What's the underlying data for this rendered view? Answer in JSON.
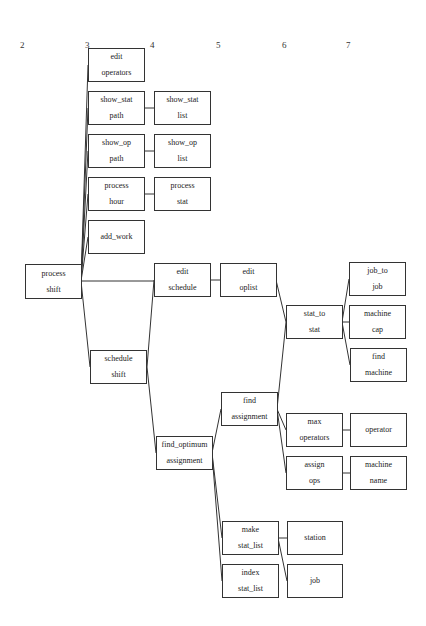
{
  "columns": [
    {
      "label": "2",
      "x": 20,
      "y": 40
    },
    {
      "label": "3",
      "x": 85,
      "y": 40
    },
    {
      "label": "4",
      "x": 150,
      "y": 40
    },
    {
      "label": "5",
      "x": 216,
      "y": 40
    },
    {
      "label": "6",
      "x": 282,
      "y": 40
    },
    {
      "label": "7",
      "x": 346,
      "y": 40
    }
  ],
  "nodes": {
    "process_shift": {
      "line1": "process",
      "line2": "shift"
    },
    "edit_operators": {
      "line1": "edit",
      "line2": "operators"
    },
    "show_stat_path": {
      "line1": "show_stat",
      "line2": "path"
    },
    "show_stat_list": {
      "line1": "show_stat",
      "line2": "list"
    },
    "show_op_path": {
      "line1": "show_op",
      "line2": "path"
    },
    "show_op_list": {
      "line1": "show_op",
      "line2": "list"
    },
    "process_hour": {
      "line1": "process",
      "line2": "hour"
    },
    "process_stat": {
      "line1": "process",
      "line2": "stat"
    },
    "add_work": {
      "line1": "add_work",
      "line2": ""
    },
    "edit_schedule": {
      "line1": "edit",
      "line2": "schedule"
    },
    "edit_oplist": {
      "line1": "edit",
      "line2": "oplist"
    },
    "schedule_shift": {
      "line1": "schedule",
      "line2": "shift"
    },
    "stat_to_stat": {
      "line1": "stat_to",
      "line2": "stat"
    },
    "job_to_job": {
      "line1": "job_to",
      "line2": "job"
    },
    "machine_cap": {
      "line1": "machine",
      "line2": "cap"
    },
    "find_machine": {
      "line1": "find",
      "line2": "machine"
    },
    "find_assignment": {
      "line1": "find",
      "line2": "assignment"
    },
    "find_optimum_assignment": {
      "line1": "find_optimum",
      "line2": "assignment"
    },
    "max_operators": {
      "line1": "max",
      "line2": "operators"
    },
    "operator": {
      "line1": "operator",
      "line2": ""
    },
    "assign_ops": {
      "line1": "assign",
      "line2": "ops"
    },
    "machine_name": {
      "line1": "machine",
      "line2": "name"
    },
    "make_stat_list": {
      "line1": "make",
      "line2": "stat_list"
    },
    "station": {
      "line1": "station",
      "line2": ""
    },
    "index_stat_list": {
      "line1": "index",
      "line2": "stat_list"
    },
    "job": {
      "line1": "job",
      "line2": ""
    }
  },
  "edges": [
    [
      "process_shift",
      "edit_operators"
    ],
    [
      "process_shift",
      "show_stat_path"
    ],
    [
      "process_shift",
      "show_op_path"
    ],
    [
      "process_shift",
      "process_hour"
    ],
    [
      "process_shift",
      "add_work"
    ],
    [
      "process_shift",
      "edit_schedule"
    ],
    [
      "process_shift",
      "schedule_shift"
    ],
    [
      "show_stat_path",
      "show_stat_list"
    ],
    [
      "show_op_path",
      "show_op_list"
    ],
    [
      "process_hour",
      "process_stat"
    ],
    [
      "edit_schedule",
      "edit_oplist"
    ],
    [
      "schedule_shift",
      "edit_schedule"
    ],
    [
      "schedule_shift",
      "find_optimum_assignment"
    ],
    [
      "edit_oplist",
      "stat_to_stat"
    ],
    [
      "find_assignment",
      "stat_to_stat"
    ],
    [
      "stat_to_stat",
      "job_to_job"
    ],
    [
      "stat_to_stat",
      "machine_cap"
    ],
    [
      "stat_to_stat",
      "find_machine"
    ],
    [
      "find_optimum_assignment",
      "find_assignment"
    ],
    [
      "find_optimum_assignment",
      "make_stat_list"
    ],
    [
      "find_optimum_assignment",
      "index_stat_list"
    ],
    [
      "find_assignment",
      "max_operators"
    ],
    [
      "find_assignment",
      "assign_ops"
    ],
    [
      "max_operators",
      "operator"
    ],
    [
      "assign_ops",
      "machine_name"
    ],
    [
      "make_stat_list",
      "station"
    ],
    [
      "make_stat_list",
      "job"
    ]
  ]
}
